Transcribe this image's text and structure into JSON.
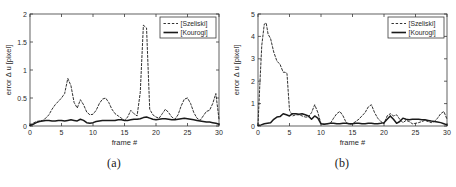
{
  "figure": {
    "panels": [
      {
        "caption": "(a)",
        "chart_data": {
          "type": "line",
          "title": "",
          "xlabel": "frame #",
          "ylabel": "error Δ u [pixel]",
          "xlim": [
            0,
            30
          ],
          "ylim": [
            0,
            2
          ],
          "xticks": [
            0,
            5,
            10,
            15,
            20,
            25,
            30
          ],
          "yticks": [
            0,
            0.5,
            1,
            1.5,
            2
          ],
          "xtick_labels": [
            "0",
            "5",
            "10",
            "15",
            "20",
            "25",
            "30"
          ],
          "ytick_labels": [
            "0",
            "0.5",
            "1",
            "1.5",
            "2"
          ],
          "grid": false,
          "legend_position": "upper right",
          "series": [
            {
              "name": "[Szeliski]",
              "style": "dashed",
              "color": "#1a1a1a",
              "x": [
                0,
                0.5,
                1,
                1.5,
                2,
                2.5,
                3,
                3.5,
                4,
                4.5,
                5,
                5.5,
                6,
                6.5,
                7,
                7.5,
                8,
                8.5,
                9,
                9.5,
                10,
                10.5,
                11,
                11.5,
                12,
                12.5,
                13,
                13.5,
                14,
                14.5,
                15,
                15.5,
                16,
                16.5,
                17,
                17.5,
                18,
                18.5,
                19,
                19.5,
                20,
                20.5,
                21,
                21.5,
                22,
                22.5,
                23,
                23.5,
                24,
                24.5,
                25,
                25.5,
                26,
                26.5,
                27,
                27.5,
                28,
                28.5,
                29,
                29.5,
                30
              ],
              "y": [
                0.02,
                0.05,
                0.08,
                0.09,
                0.1,
                0.14,
                0.2,
                0.3,
                0.38,
                0.44,
                0.5,
                0.58,
                0.85,
                0.72,
                0.42,
                0.32,
                0.47,
                0.38,
                0.25,
                0.2,
                0.21,
                0.28,
                0.4,
                0.48,
                0.5,
                0.42,
                0.3,
                0.22,
                0.18,
                0.14,
                0.1,
                0.16,
                0.28,
                0.22,
                0.18,
                0.6,
                1.8,
                1.75,
                0.3,
                0.2,
                0.16,
                0.14,
                0.22,
                0.3,
                0.24,
                0.16,
                0.12,
                0.2,
                0.36,
                0.48,
                0.5,
                0.4,
                0.24,
                0.14,
                0.1,
                0.18,
                0.26,
                0.28,
                0.4,
                0.58,
                0.12
              ]
            },
            {
              "name": "[Kourogi]",
              "style": "solid",
              "color": "#1a1a1a",
              "x": [
                0,
                0.5,
                1,
                1.5,
                2,
                2.5,
                3,
                3.5,
                4,
                4.5,
                5,
                5.5,
                6,
                6.5,
                7,
                7.5,
                8,
                8.5,
                9,
                9.5,
                10,
                10.5,
                11,
                11.5,
                12,
                12.5,
                13,
                13.5,
                14,
                14.5,
                15,
                15.5,
                16,
                16.5,
                17,
                17.5,
                18,
                18.5,
                19,
                19.5,
                20,
                20.5,
                21,
                21.5,
                22,
                22.5,
                23,
                23.5,
                24,
                24.5,
                25,
                25.5,
                26,
                26.5,
                27,
                27.5,
                28,
                28.5,
                29,
                29.5,
                30
              ],
              "y": [
                0.01,
                0.03,
                0.06,
                0.08,
                0.09,
                0.1,
                0.1,
                0.09,
                0.09,
                0.1,
                0.1,
                0.09,
                0.1,
                0.11,
                0.1,
                0.09,
                0.12,
                0.1,
                0.06,
                0.05,
                0.06,
                0.08,
                0.09,
                0.1,
                0.1,
                0.1,
                0.1,
                0.1,
                0.11,
                0.11,
                0.1,
                0.1,
                0.11,
                0.12,
                0.12,
                0.13,
                0.15,
                0.16,
                0.14,
                0.12,
                0.11,
                0.12,
                0.13,
                0.13,
                0.12,
                0.11,
                0.11,
                0.12,
                0.13,
                0.14,
                0.13,
                0.12,
                0.11,
                0.1,
                0.09,
                0.08,
                0.07,
                0.07,
                0.06,
                0.05,
                0.03
              ]
            }
          ]
        }
      },
      {
        "caption": "(b)",
        "chart_data": {
          "type": "line",
          "title": "",
          "xlabel": "frame #",
          "ylabel": "error Δ u [pixel]",
          "xlim": [
            0,
            30
          ],
          "ylim": [
            0,
            5
          ],
          "xticks": [
            0,
            5,
            10,
            15,
            20,
            25,
            30
          ],
          "yticks": [
            0,
            1,
            2,
            3,
            4,
            5
          ],
          "xtick_labels": [
            "0",
            "5",
            "10",
            "15",
            "20",
            "25",
            "30"
          ],
          "ytick_labels": [
            "0",
            "1",
            "2",
            "3",
            "4",
            "5"
          ],
          "grid": false,
          "legend_position": "upper right",
          "series": [
            {
              "name": "[Szeliski]",
              "style": "dashed",
              "color": "#1a1a1a",
              "x": [
                0,
                0.3,
                0.6,
                1,
                1.3,
                1.6,
                2,
                2.5,
                3,
                3.5,
                4,
                4.3,
                4.6,
                5,
                5.5,
                6,
                6.5,
                7,
                7.5,
                8,
                8.5,
                9,
                9.5,
                10,
                10.5,
                11,
                11.5,
                12,
                12.5,
                13,
                13.5,
                14,
                14.5,
                15,
                15.5,
                16,
                16.5,
                17,
                17.5,
                18,
                18.5,
                19,
                19.5,
                20,
                20.5,
                21,
                21.5,
                22,
                22.5,
                23,
                23.5,
                24,
                24.5,
                25,
                25.5,
                26,
                26.5,
                27,
                27.5,
                28,
                28.5,
                29,
                29.5,
                30
              ],
              "y": [
                0.05,
                1.9,
                3.6,
                4.55,
                4.6,
                4.1,
                3.9,
                3.3,
                2.9,
                2.75,
                2.4,
                2.4,
                2.35,
                0.7,
                0.45,
                0.5,
                0.5,
                0.45,
                0.4,
                0.4,
                0.6,
                0.95,
                0.6,
                0.1,
                0.08,
                0.1,
                0.12,
                0.35,
                0.55,
                0.65,
                0.45,
                0.15,
                0.08,
                0.1,
                0.2,
                0.3,
                0.45,
                0.6,
                0.85,
                0.95,
                0.6,
                0.35,
                0.2,
                0.1,
                0.45,
                0.55,
                0.45,
                0.5,
                0.3,
                0.15,
                0.25,
                0.2,
                0.1,
                0.12,
                0.15,
                0.2,
                0.25,
                0.2,
                0.15,
                0.2,
                0.35,
                0.55,
                0.65,
                0.3,
                0.05
              ]
            },
            {
              "name": "[Kourogi]",
              "style": "solid",
              "color": "#1a1a1a",
              "x": [
                0,
                0.5,
                1,
                1.5,
                2,
                2.5,
                3,
                3.5,
                4,
                4.5,
                5,
                5.5,
                6,
                6.5,
                7,
                7.5,
                8,
                8.5,
                9,
                9.5,
                10,
                10.5,
                11,
                11.5,
                12,
                12.5,
                13,
                13.5,
                14,
                14.5,
                15,
                15.5,
                16,
                16.5,
                17,
                17.5,
                18,
                18.5,
                19,
                19.5,
                20,
                20.5,
                21,
                21.5,
                22,
                22.5,
                23,
                23.5,
                24,
                24.5,
                25,
                25.5,
                26,
                26.5,
                27,
                27.5,
                28,
                28.5,
                29,
                29.5,
                30
              ],
              "y": [
                0.02,
                0.05,
                0.1,
                0.12,
                0.14,
                0.3,
                0.4,
                0.42,
                0.55,
                0.5,
                0.45,
                0.55,
                0.55,
                0.52,
                0.55,
                0.5,
                0.45,
                0.3,
                0.45,
                0.35,
                0.1,
                0.08,
                0.1,
                0.12,
                0.12,
                0.1,
                0.1,
                0.12,
                0.12,
                0.1,
                0.1,
                0.12,
                0.12,
                0.1,
                0.1,
                0.12,
                0.12,
                0.1,
                0.1,
                0.12,
                0.15,
                0.3,
                0.45,
                0.3,
                0.12,
                0.2,
                0.35,
                0.3,
                0.28,
                0.3,
                0.3,
                0.3,
                0.28,
                0.28,
                0.25,
                0.22,
                0.2,
                0.18,
                0.15,
                0.1,
                0.05
              ]
            }
          ]
        }
      }
    ]
  }
}
